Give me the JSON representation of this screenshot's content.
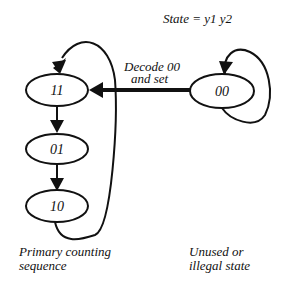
{
  "diagram": {
    "header": "State = y1 y2",
    "states": [
      {
        "id": "s11",
        "label": "11"
      },
      {
        "id": "s01",
        "label": "01"
      },
      {
        "id": "s10",
        "label": "10"
      },
      {
        "id": "s00",
        "label": "00"
      }
    ],
    "transition_label_line1": "Decode 00",
    "transition_label_line2": "and set",
    "caption_left_line1": "Primary counting",
    "caption_left_line2": "sequence",
    "caption_right_line1": "Unused or",
    "caption_right_line2": "illegal state",
    "colors": {
      "stroke": "#111111",
      "background": "#ffffff"
    }
  }
}
